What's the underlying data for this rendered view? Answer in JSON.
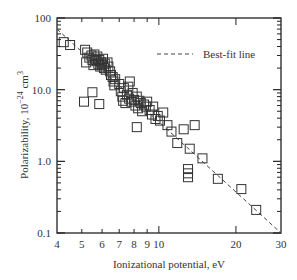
{
  "chart_data": {
    "type": "scatter",
    "title": "",
    "xlabel": "Ionizational potential, eV",
    "ylabel": "Polarizability, 10^-24 cm^3",
    "ylabel_parts": {
      "base": "Polarizability, 10",
      "exp": "−24",
      "unit": " cm",
      "unit_exp": "3"
    },
    "xscale": "log",
    "yscale": "log",
    "xlim": [
      4,
      30
    ],
    "ylim": [
      0.1,
      100
    ],
    "x_ticks": [
      4,
      5,
      6,
      7,
      8,
      9,
      10,
      20,
      30
    ],
    "x_tick_labels": [
      "4",
      "5",
      "6",
      "7",
      "8",
      "9",
      "10",
      "20",
      "30"
    ],
    "y_ticks": [
      0.1,
      1.0,
      10.0,
      100
    ],
    "y_tick_labels": [
      "0.1",
      "1.0",
      "10.0",
      "100"
    ],
    "grid": false,
    "legend": {
      "position": "upper right",
      "entries": [
        {
          "label": "Best-fit line",
          "style": "dashed"
        }
      ]
    },
    "series": [
      {
        "name": "Data",
        "marker": "open-square",
        "points": [
          [
            4.25,
            46
          ],
          [
            4.5,
            42
          ],
          [
            5.15,
            36
          ],
          [
            5.25,
            33
          ],
          [
            5.2,
            24
          ],
          [
            5.35,
            28
          ],
          [
            5.45,
            30
          ],
          [
            5.5,
            26
          ],
          [
            5.55,
            22
          ],
          [
            5.6,
            31
          ],
          [
            5.65,
            27
          ],
          [
            5.7,
            25
          ],
          [
            5.75,
            29
          ],
          [
            5.8,
            23
          ],
          [
            5.85,
            26
          ],
          [
            5.9,
            21
          ],
          [
            5.95,
            24
          ],
          [
            6.0,
            22
          ],
          [
            6.05,
            27
          ],
          [
            6.1,
            20
          ],
          [
            6.15,
            23
          ],
          [
            6.2,
            19
          ],
          [
            6.3,
            24
          ],
          [
            6.35,
            21
          ],
          [
            6.45,
            18
          ],
          [
            6.5,
            16
          ],
          [
            6.6,
            15
          ],
          [
            6.65,
            13
          ],
          [
            6.7,
            11.5
          ],
          [
            6.75,
            14
          ],
          [
            5.5,
            9.2
          ],
          [
            5.1,
            6.8
          ],
          [
            5.85,
            6.3
          ],
          [
            7.0,
            12
          ],
          [
            7.1,
            9.5
          ],
          [
            7.2,
            8
          ],
          [
            7.25,
            7
          ],
          [
            7.3,
            10.5
          ],
          [
            7.4,
            6.5
          ],
          [
            7.5,
            8.5
          ],
          [
            7.6,
            11
          ],
          [
            7.65,
            7.5
          ],
          [
            7.7,
            13
          ],
          [
            7.8,
            6.8
          ],
          [
            7.9,
            9
          ],
          [
            8.0,
            7.2
          ],
          [
            8.1,
            6
          ],
          [
            8.2,
            8
          ],
          [
            8.3,
            5.5
          ],
          [
            8.4,
            7
          ],
          [
            8.5,
            6.5
          ],
          [
            8.6,
            5
          ],
          [
            8.75,
            6.2
          ],
          [
            8.9,
            5.8
          ],
          [
            9.0,
            6.8
          ],
          [
            9.2,
            5.2
          ],
          [
            9.4,
            4.5
          ],
          [
            9.5,
            5.8
          ],
          [
            9.7,
            3.9
          ],
          [
            9.9,
            4.3
          ],
          [
            10.1,
            3.7
          ],
          [
            10.4,
            4.8
          ],
          [
            8.2,
            3.0
          ],
          [
            10.8,
            3.2
          ],
          [
            11.2,
            2.6
          ],
          [
            11.8,
            1.8
          ],
          [
            12.5,
            2.8
          ],
          [
            13.2,
            1.5
          ],
          [
            13.8,
            3.2
          ],
          [
            13.0,
            0.78
          ],
          [
            13.0,
            0.68
          ],
          [
            13.0,
            0.6
          ],
          [
            14.8,
            1.1
          ],
          [
            17.0,
            0.57
          ],
          [
            21.0,
            0.41
          ],
          [
            24.0,
            0.21
          ]
        ]
      }
    ],
    "fit_line": {
      "name": "Best-fit line",
      "style": "dashed",
      "from": [
        4.0,
        70
      ],
      "to": [
        30,
        0.1
      ]
    }
  }
}
